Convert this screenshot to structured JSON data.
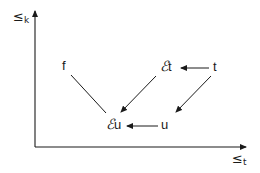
{
  "diagram": {
    "axes": {
      "y_label": {
        "symbol": "≤",
        "subscript": "k"
      },
      "x_label": {
        "symbol": "≤",
        "subscript": "t"
      }
    },
    "nodes": {
      "f": {
        "label": "f"
      },
      "eps_t": {
        "prefix": "ℰ",
        "label": "t"
      },
      "t": {
        "label": "t"
      },
      "eps_u": {
        "prefix": "ℰ",
        "label": "u"
      },
      "u": {
        "label": "u"
      }
    },
    "edges": [
      {
        "from": "t",
        "to": "eps_t",
        "arrow": true
      },
      {
        "from": "t",
        "to": "u",
        "arrow": true
      },
      {
        "from": "eps_t",
        "to": "eps_u",
        "arrow": true
      },
      {
        "from": "u",
        "to": "eps_u",
        "arrow": true
      },
      {
        "from": "f",
        "to": "eps_u",
        "arrow": false
      }
    ],
    "colors": {
      "ink": "#1a1a1a",
      "background": "#ffffff"
    }
  }
}
